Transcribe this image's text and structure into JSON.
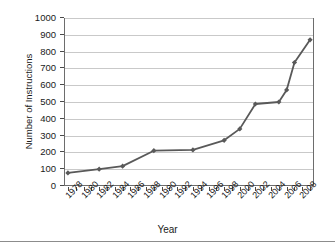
{
  "chart_data": {
    "type": "line",
    "title": "",
    "xlabel": "Year",
    "ylabel": "Number of Instructions",
    "xlim": [
      1977.5,
      2009.5
    ],
    "ylim": [
      0,
      1000
    ],
    "grid": true,
    "legend": "none",
    "series_color": "#595959",
    "marker": "diamond",
    "y_ticks": [
      0,
      100,
      200,
      300,
      400,
      500,
      600,
      700,
      800,
      900,
      1000
    ],
    "y_tick_labels": [
      "0",
      "100",
      "200",
      "300",
      "400",
      "500",
      "600",
      "700",
      "800",
      "900",
      "1000"
    ],
    "x_tick_labels": [
      "1978",
      "1980",
      "1982",
      "1984",
      "1986",
      "1988",
      "1990",
      "1992",
      "1994",
      "1996",
      "1998",
      "2000",
      "2002",
      "2004",
      "2006",
      "2008"
    ],
    "x_minor_tick_interval": 1,
    "x": [
      1978,
      1982,
      1985,
      1989,
      1994,
      1998,
      2000,
      2002,
      2005,
      2006,
      2007,
      2009
    ],
    "values": [
      78,
      100,
      118,
      210,
      215,
      272,
      340,
      488,
      500,
      572,
      735,
      870
    ],
    "points": [
      {
        "x": 1978,
        "y": 78
      },
      {
        "x": 1982,
        "y": 100
      },
      {
        "x": 1985,
        "y": 118
      },
      {
        "x": 1989,
        "y": 210
      },
      {
        "x": 1994,
        "y": 215
      },
      {
        "x": 1998,
        "y": 272
      },
      {
        "x": 2000,
        "y": 340
      },
      {
        "x": 2002,
        "y": 488
      },
      {
        "x": 2005,
        "y": 500
      },
      {
        "x": 2006,
        "y": 572
      },
      {
        "x": 2007,
        "y": 735
      },
      {
        "x": 2009,
        "y": 870
      }
    ]
  }
}
